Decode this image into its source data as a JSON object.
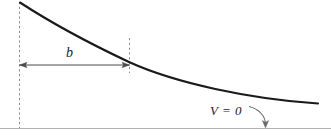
{
  "figure": {
    "type": "diagram",
    "background_color": "#ffffff"
  },
  "labels": {
    "width_label": "b",
    "baseline_label": "V = 0"
  },
  "colors": {
    "curve": "#1a1a1a",
    "dashed_line": "#8c8c8c",
    "arrow": "#4a4a4a",
    "baseline": "#b0b0b0",
    "text": "#1a1a1a"
  },
  "geometry": {
    "curve": {
      "name": "potential-curve",
      "start": [
        20,
        2
      ],
      "end": [
        318,
        103
      ],
      "shape": "convex-decaying"
    },
    "left_dashed_line": {
      "name": "left-boundary-dashed-line",
      "x": 19,
      "y_top": 2,
      "y_bottom": 128
    },
    "middle_dashed_line": {
      "name": "width-end-dashed-line",
      "x": 129,
      "y_top": 38,
      "y_bottom": 73
    },
    "dimension_arrow": {
      "name": "width-dimension-arrow",
      "y": 65,
      "x_start": 19,
      "x_end": 129,
      "double_headed": true
    },
    "baseline": {
      "name": "zero-potential-baseline",
      "y": 128,
      "x_start": 0,
      "x_end": 331
    },
    "pointer_arrow": {
      "name": "baseline-pointer-arrow",
      "from": [
        250,
        107
      ],
      "to": [
        265,
        127
      ]
    }
  }
}
